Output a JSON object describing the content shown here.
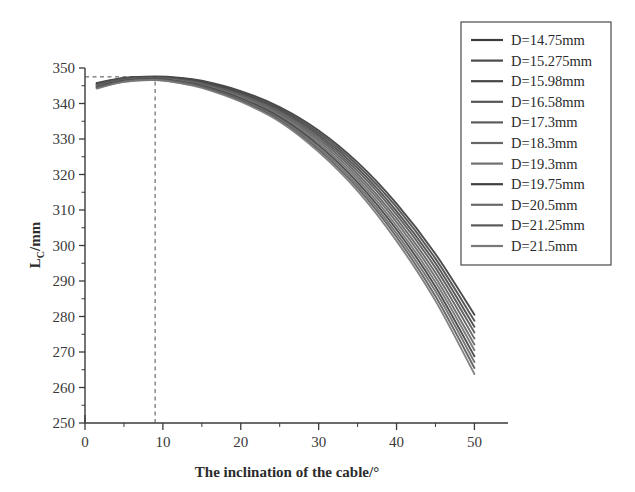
{
  "chart_data": {
    "type": "line",
    "title": "",
    "xlabel": "The inclination of the cable/°",
    "ylabel": "L_C/mm",
    "ylabel_base": "L",
    "ylabel_sub": "C",
    "ylabel_unit": "/mm",
    "xlim": [
      0,
      52
    ],
    "ylim": [
      250,
      350
    ],
    "xticks": [
      0,
      10,
      20,
      30,
      40,
      50
    ],
    "xtick_labels": [
      "0",
      "10",
      "20",
      "30",
      "40",
      "50"
    ],
    "xminor_step": 5,
    "yticks": [
      250,
      260,
      270,
      280,
      290,
      300,
      310,
      320,
      330,
      340,
      350
    ],
    "ytick_labels": [
      "250",
      "260",
      "270",
      "280",
      "290",
      "300",
      "310",
      "320",
      "330",
      "340",
      "350"
    ],
    "yminor_step": 5,
    "grid": false,
    "legend_position": "top-right",
    "annotations": [
      {
        "name": "peak-guide-vertical",
        "type": "dashed-line",
        "x": 9,
        "y_from": 250,
        "y_to": 347.5
      },
      {
        "name": "peak-guide-horizontal",
        "type": "dashed-line",
        "y": 347.5,
        "x_from": 0,
        "x_to": 9
      }
    ],
    "x": [
      1.5,
      5,
      9,
      12,
      15,
      20,
      25,
      30,
      35,
      40,
      45,
      50
    ],
    "series": [
      {
        "name": "D=14.75mm",
        "color": "#3c3c3c",
        "values": [
          345.8,
          347.2,
          347.6,
          347.3,
          346.4,
          343.5,
          339.0,
          332.4,
          323.4,
          311.8,
          297.6,
          280.5
        ]
      },
      {
        "name": "D=15.275mm",
        "color": "#4a4a4a",
        "values": [
          345.6,
          347.1,
          347.5,
          347.1,
          346.2,
          343.2,
          338.6,
          331.8,
          322.6,
          310.8,
          296.3,
          278.8
        ]
      },
      {
        "name": "D=15.98mm",
        "color": "#454545",
        "values": [
          345.5,
          347.0,
          347.4,
          347.0,
          346.0,
          342.9,
          338.2,
          331.2,
          321.8,
          309.7,
          295.0,
          277.1
        ]
      },
      {
        "name": "D=16.58mm",
        "color": "#555555",
        "values": [
          345.3,
          346.9,
          347.3,
          346.8,
          345.8,
          342.6,
          337.8,
          330.6,
          321.0,
          308.7,
          293.7,
          275.5
        ]
      },
      {
        "name": "D=17.3mm",
        "color": "#5c5c5c",
        "values": [
          345.2,
          346.8,
          347.2,
          346.7,
          345.6,
          342.3,
          337.3,
          330.0,
          320.2,
          307.6,
          292.3,
          273.8
        ]
      },
      {
        "name": "D=18.3mm",
        "color": "#666666",
        "values": [
          345.0,
          346.6,
          347.1,
          346.5,
          345.4,
          342.0,
          336.9,
          329.4,
          319.4,
          306.6,
          291.0,
          272.1
        ]
      },
      {
        "name": "D=19.3mm",
        "color": "#707070",
        "values": [
          344.8,
          346.5,
          347.0,
          346.4,
          345.2,
          341.7,
          336.5,
          328.8,
          318.6,
          305.5,
          289.7,
          270.5
        ]
      },
      {
        "name": "D=19.75mm",
        "color": "#3f3f3f",
        "values": [
          344.7,
          346.4,
          346.9,
          346.2,
          345.0,
          341.4,
          336.1,
          328.2,
          317.8,
          304.5,
          288.4,
          268.8
        ]
      },
      {
        "name": "D=20.5mm",
        "color": "#6a6a6a",
        "values": [
          344.5,
          346.3,
          346.8,
          346.1,
          344.8,
          341.1,
          335.7,
          327.6,
          317.0,
          303.4,
          287.1,
          267.2
        ]
      },
      {
        "name": "D=21.25mm",
        "color": "#5a5a5a",
        "values": [
          344.4,
          346.2,
          346.7,
          345.9,
          344.6,
          340.8,
          335.3,
          327.0,
          316.2,
          302.4,
          285.7,
          265.5
        ]
      },
      {
        "name": "D=21.5mm",
        "color": "#787878",
        "values": [
          344.2,
          346.1,
          346.6,
          345.8,
          344.4,
          340.5,
          334.9,
          326.4,
          315.4,
          301.3,
          284.4,
          263.8
        ]
      }
    ]
  },
  "legend": {
    "items": [
      {
        "label": "D=14.75mm"
      },
      {
        "label": "D=15.275mm"
      },
      {
        "label": "D=15.98mm"
      },
      {
        "label": "D=16.58mm"
      },
      {
        "label": "D=17.3mm"
      },
      {
        "label": "D=18.3mm"
      },
      {
        "label": "D=19.3mm"
      },
      {
        "label": "D=19.75mm"
      },
      {
        "label": "D=20.5mm"
      },
      {
        "label": "D=21.25mm"
      },
      {
        "label": "D=21.5mm"
      }
    ]
  },
  "colors": {
    "axis": "#3a3a3a",
    "text": "#2b2b2b",
    "curve_dark": "#3c3c3c",
    "curve_light": "#8a8a8a",
    "legend_border": "#4a4a4a",
    "background": "#ffffff"
  }
}
